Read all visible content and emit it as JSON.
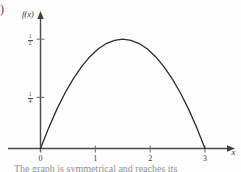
{
  "figure": {
    "corner_marker": ")",
    "caption_clipped": "The graph is symmetrical and reaches its"
  },
  "chart_data": {
    "type": "line",
    "title": "",
    "subtitle": "",
    "xlabel": "x",
    "ylabel": "f(x)",
    "xlim": [
      -0.35,
      3.45
    ],
    "ylim": [
      0,
      0.62
    ],
    "grid": false,
    "legend": null,
    "x_ticks": [
      {
        "value": 0,
        "label": "0"
      },
      {
        "value": 1,
        "label": "1"
      },
      {
        "value": 2,
        "label": "2"
      },
      {
        "value": 3,
        "label": "3"
      }
    ],
    "y_ticks": [
      {
        "value": 0.25,
        "label": "1/4",
        "numerator": "1",
        "denominator": "4"
      },
      {
        "value": 0.5,
        "label": "1/2",
        "numerator": "1",
        "denominator": "2"
      }
    ],
    "series": [
      {
        "name": "f(x)",
        "type": "line",
        "x": [
          0,
          0.15,
          0.3,
          0.45,
          0.6,
          0.75,
          0.9,
          1.05,
          1.2,
          1.35,
          1.5,
          1.65,
          1.8,
          1.95,
          2.1,
          2.25,
          2.4,
          2.55,
          2.7,
          2.85,
          3
        ],
        "y": [
          0,
          0.095,
          0.18,
          0.255,
          0.32,
          0.375,
          0.42,
          0.455,
          0.48,
          0.495,
          0.5,
          0.495,
          0.48,
          0.455,
          0.42,
          0.375,
          0.32,
          0.255,
          0.18,
          0.095,
          0
        ]
      }
    ],
    "annotations": [
      {
        "text": "peak value 1/2 at x = 1.5",
        "x": 1.5,
        "y": 0.5
      }
    ]
  },
  "colors": {
    "curve": "#2b2b2b",
    "axis": "#4a4a4a",
    "text": "#3a3a3a",
    "background": "#fdfdfd"
  }
}
